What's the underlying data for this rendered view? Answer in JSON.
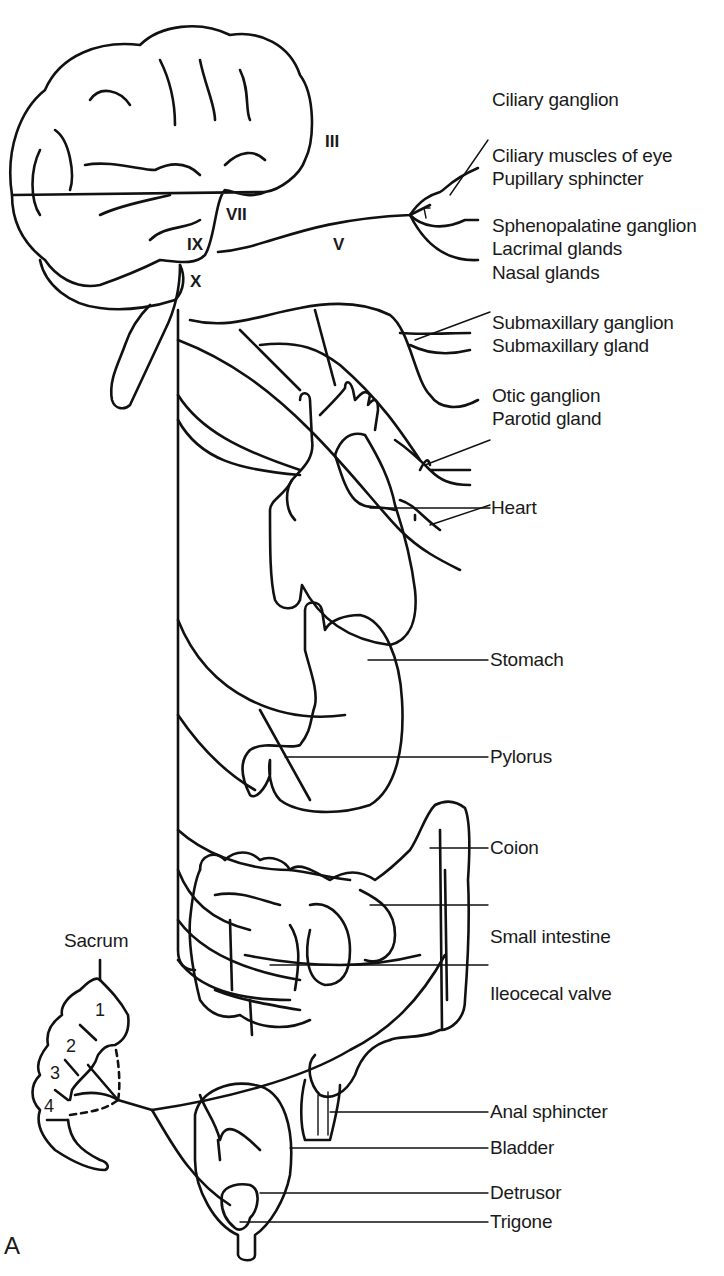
{
  "figure": {
    "panel_letter": "A",
    "cranial_nerves": {
      "III": "III",
      "VII": "VII",
      "IX": "IX",
      "V": "V",
      "X": "X"
    },
    "labels": {
      "ciliary_ganglion": "Ciliary ganglion",
      "ciliary_muscles": "Ciliary muscles of eye",
      "pupillary_sphincter": "Pupillary sphincter",
      "sphenopalatine_ganglion": "Sphenopalatine ganglion",
      "lacrimal_glands": "Lacrimal glands",
      "nasal_glands": "Nasal glands",
      "submaxillary_ganglion": "Submaxillary ganglion",
      "submaxillary_gland": "Submaxillary gland",
      "otic_ganglion": "Otic ganglion",
      "parotid_gland": "Parotid gland",
      "heart": "Heart",
      "stomach": "Stomach",
      "pylorus": "Pylorus",
      "colon": "Coion",
      "small_intestine": "Small intestine",
      "ileocecal_valve": "Ileocecal valve",
      "sacrum": "Sacrum",
      "anal_sphincter": "Anal sphincter",
      "bladder": "Bladder",
      "detrusor": "Detrusor",
      "trigone": "Trigone"
    },
    "sacral_segments": [
      "1",
      "2",
      "3",
      "4"
    ]
  }
}
